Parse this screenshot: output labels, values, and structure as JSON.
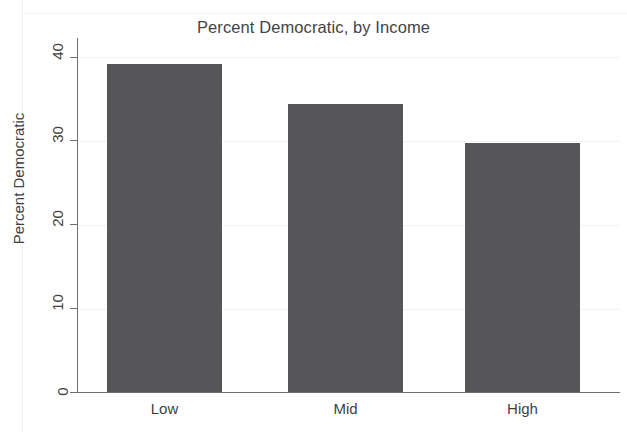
{
  "chart_data": {
    "type": "bar",
    "title": "Percent Democratic, by Income",
    "xlabel": "",
    "ylabel": "Percent Democratic",
    "categories": [
      "Low",
      "Mid",
      "High"
    ],
    "values": [
      39.2,
      34.4,
      29.7
    ],
    "ylim": [
      0,
      41.5
    ],
    "yticks": [
      0,
      10,
      20,
      30,
      40
    ],
    "ytick_labels": [
      "0",
      "10",
      "20",
      "30",
      "40"
    ],
    "grid": true,
    "grid_axis": "y",
    "legend": false,
    "legend_position": "none",
    "bar_color": "#565658",
    "axis_color": "#6e6e6e",
    "grid_color": "#f2f2f2",
    "background_color": "#ffffff",
    "ytick_rotation": -90
  },
  "figure": {
    "title": "Percent Democratic, by Income",
    "y_axis_title": "Percent Democratic"
  }
}
